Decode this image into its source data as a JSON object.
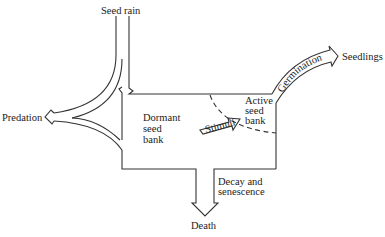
{
  "diagram": {
    "nodes": {
      "seed_rain": "Seed rain",
      "predation": "Predation",
      "dormant": [
        "Dormant",
        "seed",
        "bank"
      ],
      "active": [
        "Active",
        "seed",
        "bank"
      ],
      "seedlings": "Seedlings",
      "death": "Death"
    },
    "flows": {
      "germination": "Germination",
      "stimuli": "Stimuli",
      "decay": [
        "Decay and",
        "senescence"
      ]
    },
    "edges": [
      {
        "from": "Seed rain",
        "to": "Dormant seed bank"
      },
      {
        "from": "Seed rain",
        "to": "Predation"
      },
      {
        "from": "Dormant seed bank",
        "to": "Predation"
      },
      {
        "from": "Dormant seed bank",
        "to": "Active seed bank",
        "label": "Stimuli"
      },
      {
        "from": "Active seed bank",
        "to": "Seedlings",
        "label": "Germination"
      },
      {
        "from": "Seed bank",
        "to": "Death",
        "label": "Decay and senescence"
      }
    ],
    "colors": {
      "line": "#333333",
      "text": "#222222",
      "background": "#ffffff"
    }
  }
}
